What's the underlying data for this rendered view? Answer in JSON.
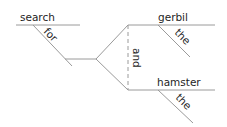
{
  "diagram": {
    "type": "sentence-diagram",
    "words": {
      "verb": "search",
      "preposition": "for",
      "conjunction": "and",
      "object1": "gerbil",
      "object1_article": "the",
      "object2": "hamster",
      "object2_article": "the"
    },
    "colors": {
      "line": "#9a9a9a",
      "text": "#1e1e1e",
      "background": "#ffffff"
    }
  }
}
